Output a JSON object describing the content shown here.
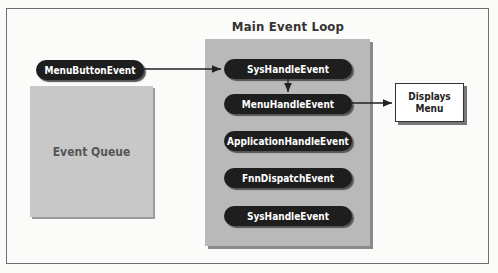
{
  "diagram": {
    "loop_title": "Main Event Loop",
    "queue_label": "Event Queue",
    "source_event": "MenuButtonEvent",
    "loop_items": [
      "SysHandleEvent",
      "MenuHandleEvent",
      "ApplicationHandleEvent",
      "FnnDispatchEvent",
      "SysHandleEvent"
    ],
    "output_box": {
      "line1": "Displays",
      "line2": "Menu"
    },
    "colors": {
      "pill": "#1e1e1e",
      "loop_box": "#b9b9b9",
      "queue_box": "#c8c8c8",
      "background": "#fbfbf9"
    }
  }
}
